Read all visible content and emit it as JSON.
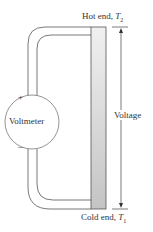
{
  "diagram": {
    "hot_end": {
      "label": "Hot end, ",
      "var": "T",
      "sub": "2"
    },
    "cold_end": {
      "label": "Cold end, ",
      "var": "T",
      "sub": "1"
    },
    "voltmeter": {
      "label": "Voltmeter",
      "plus": "+",
      "minus": "–"
    },
    "voltage_label": "Voltage",
    "colors": {
      "bar_top": "#eeeeee",
      "bar_bottom": "#c8c8c8",
      "line": "#555555"
    }
  }
}
